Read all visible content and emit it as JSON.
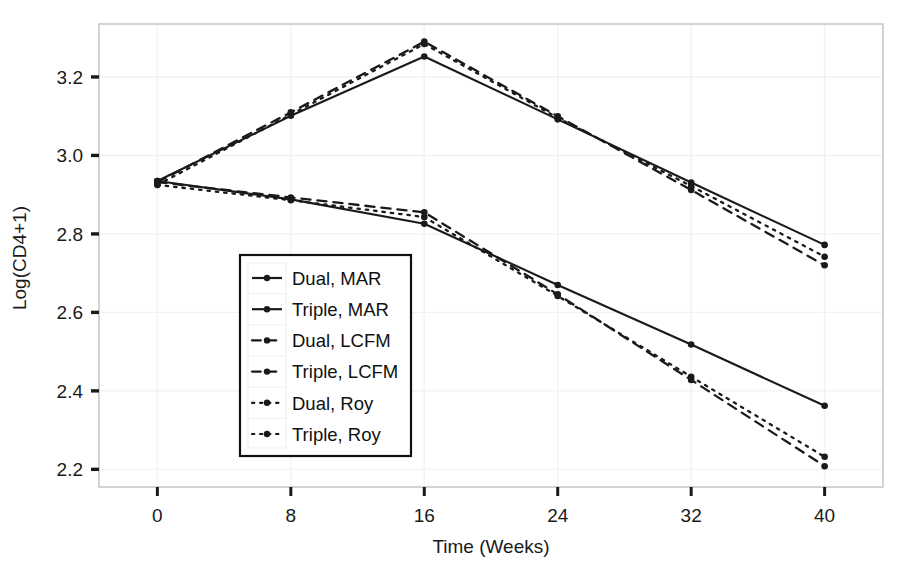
{
  "chart_data": {
    "type": "line",
    "title": "",
    "xlabel": "Time (Weeks)",
    "ylabel": "Log(CD4+1)",
    "x": [
      0,
      8,
      16,
      24,
      32,
      40
    ],
    "xtick_labels": [
      "0",
      "8",
      "16",
      "24",
      "32",
      "40"
    ],
    "ytick_labels": [
      "2.2",
      "2.4",
      "2.6",
      "2.8",
      "3.0",
      "3.2"
    ],
    "ytick_values": [
      2.2,
      2.4,
      2.6,
      2.8,
      3.0,
      3.2
    ],
    "xlim": [
      -3.5,
      43.5
    ],
    "ylim": [
      2.155,
      3.335
    ],
    "grid": true,
    "legend_position": "center-left-inside",
    "series": [
      {
        "name": "Dual, MAR",
        "style": "solid",
        "marker": "filled-circle",
        "color": "#1a1a1a",
        "values": [
          2.935,
          2.888,
          2.826,
          2.67,
          2.518,
          2.362
        ]
      },
      {
        "name": "Triple, MAR",
        "style": "solid",
        "marker": "filled-circle",
        "color": "#1a1a1a",
        "values": [
          2.935,
          3.101,
          3.252,
          3.092,
          2.931,
          2.772
        ]
      },
      {
        "name": "Dual, LCFM",
        "style": "dashed",
        "marker": "filled-circle",
        "color": "#1a1a1a",
        "values": [
          2.932,
          2.893,
          2.855,
          2.646,
          2.428,
          2.208
        ]
      },
      {
        "name": "Triple, LCFM",
        "style": "dashed",
        "marker": "filled-circle",
        "color": "#1a1a1a",
        "values": [
          2.932,
          3.11,
          3.29,
          3.1,
          2.912,
          2.72
        ]
      },
      {
        "name": "Dual, Roy",
        "style": "dotted",
        "marker": "filled-circle",
        "color": "#1a1a1a",
        "values": [
          2.925,
          2.886,
          2.843,
          2.642,
          2.436,
          2.232
        ]
      },
      {
        "name": "Triple, Roy",
        "style": "dotted",
        "marker": "filled-circle",
        "color": "#1a1a1a",
        "values": [
          2.925,
          3.104,
          3.284,
          3.096,
          2.922,
          2.742
        ]
      }
    ]
  },
  "axes": {
    "x_title": "Time (Weeks)",
    "y_title": "Log(CD4+1)",
    "x_ticks": [
      "0",
      "8",
      "16",
      "24",
      "32",
      "40"
    ],
    "y_ticks": [
      "3.2",
      "3.0",
      "2.8",
      "2.6",
      "2.4",
      "2.2"
    ]
  },
  "legend": {
    "items": [
      {
        "label": "Dual, MAR",
        "style": "solid"
      },
      {
        "label": "Triple, MAR",
        "style": "solid"
      },
      {
        "label": "Dual, LCFM",
        "style": "dashed"
      },
      {
        "label": "Triple, LCFM",
        "style": "dashed"
      },
      {
        "label": "Dual, Roy",
        "style": "dotted"
      },
      {
        "label": "Triple, Roy",
        "style": "dotted"
      }
    ]
  },
  "colors": {
    "line": "#1a1a1a",
    "frame": "#c9c9c9",
    "grid": "#f2f2f2",
    "text": "#1a1a1a",
    "legend_border": "#111111",
    "background": "#ffffff"
  }
}
